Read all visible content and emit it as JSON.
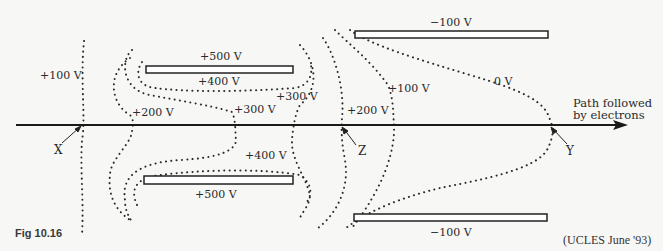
{
  "figure": {
    "caption": "Fig 10.16",
    "source": "(UCLES June '93)"
  },
  "plates": {
    "upper_left": "+500 V",
    "lower_left": "+500 V",
    "upper_right": "−100 V",
    "lower_right": "−100 V"
  },
  "equipotentials": {
    "v100_left": "+100 V",
    "v400_upper": "+400 V",
    "v400_lower": "+400 V",
    "v200_left": "+200 V",
    "v300_mid": "+300 V",
    "v300_right": "+300 V",
    "v200_right": "+200 V",
    "v100_right": "+100 V",
    "v0": "0 V"
  },
  "points": {
    "x": "X",
    "z": "Z",
    "y": "Y"
  },
  "path_label": {
    "line1": "Path followed",
    "line2": "by electrons"
  }
}
